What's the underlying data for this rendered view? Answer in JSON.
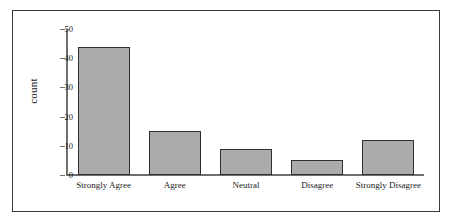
{
  "chart_data": {
    "type": "bar",
    "title": "",
    "xlabel": "",
    "ylabel": "count",
    "categories": [
      "Strongly Agree",
      "Agree",
      "Neutral",
      "Disagree",
      "Strongly Disagree"
    ],
    "values": [
      44,
      15,
      9,
      5,
      12
    ],
    "ylim": [
      0,
      50
    ],
    "yticks": [
      0,
      10,
      20,
      30,
      40,
      50
    ],
    "ytick_labels": [
      "0",
      "10",
      "20",
      "30",
      "40",
      "50"
    ],
    "grid": false,
    "legend": null,
    "bar_fill_color": "#ababab",
    "bar_edge_color": "#2f2f2f",
    "axis_color": "#6f6f6f",
    "frame_color": "#3a3a3a",
    "background_color": "#ffffff"
  }
}
